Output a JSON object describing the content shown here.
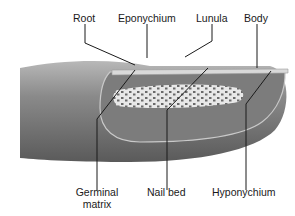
{
  "diagram": {
    "labels": {
      "root": "Root",
      "eponychium": "Eponychium",
      "lunula": "Lunula",
      "body": "Body",
      "germinal_matrix_1": "Germinal",
      "germinal_matrix_2": "matrix",
      "nail_bed": "Nail bed",
      "hyponychium": "Hyponychium"
    },
    "colors": {
      "skin_dark": "#6e6e6e",
      "skin_light": "#9a9a9a",
      "nail_bed": "#7f7f7f",
      "matrix_speckle_bg": "#e6e6e6",
      "leader_line": "#1a1a1a"
    }
  }
}
